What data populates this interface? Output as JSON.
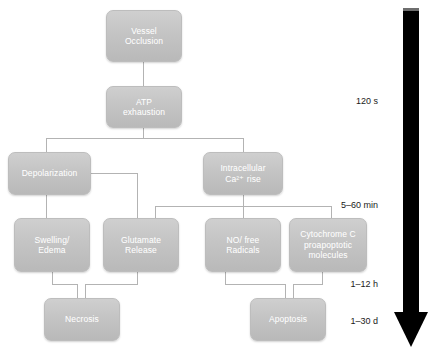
{
  "diagram": {
    "node_fill": "#c4c4c4",
    "node_text_color": "#ffffff",
    "connector_color": "#b3b3b3",
    "arrow_color": "#000000",
    "nodes": [
      {
        "id": "vessel-occlusion",
        "lines": [
          "Vessel",
          "Occlusion"
        ]
      },
      {
        "id": "atp-exhaustion",
        "lines": [
          "ATP",
          "exhaustion"
        ]
      },
      {
        "id": "depolarization",
        "lines": [
          "Depolarization"
        ]
      },
      {
        "id": "intracellular-ca",
        "lines": [
          "Intracellular",
          "Ca²⁺ rise"
        ]
      },
      {
        "id": "swelling-edema",
        "lines": [
          "Swelling/",
          "Edema"
        ]
      },
      {
        "id": "glutamate-release",
        "lines": [
          "Glutamate",
          "Release"
        ]
      },
      {
        "id": "no-free-radicals",
        "lines": [
          "NO/ free",
          "Radicals"
        ]
      },
      {
        "id": "cytochrome-c",
        "lines": [
          "Cytochrome C",
          "proapoptotic",
          "molecules"
        ]
      },
      {
        "id": "necrosis",
        "lines": [
          "Necrosis"
        ]
      },
      {
        "id": "apoptosis",
        "lines": [
          "Apoptosis"
        ]
      }
    ],
    "timeline": {
      "labels": [
        {
          "id": "t-120s",
          "text": "120 s"
        },
        {
          "id": "t-5-60min",
          "text": "5–60 min"
        },
        {
          "id": "t-1-12h",
          "text": "1–12 h"
        },
        {
          "id": "t-1-30d",
          "text": "1–30 d"
        }
      ]
    }
  }
}
